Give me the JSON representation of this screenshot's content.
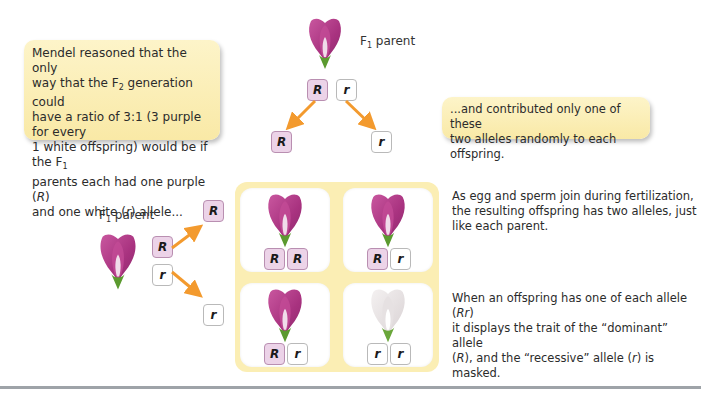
{
  "callouts": {
    "left": {
      "line1": "Mendel reasoned that the only",
      "line2_pre": "way that the F",
      "line2_sub": "2",
      "line2_post": " generation could",
      "line3": "have a ratio of 3:1 (3 purple for every",
      "line4_pre": "1 white offspring) would be if the F",
      "line4_sub": "1",
      "line5_pre": "parents each had one purple (",
      "line5_em": "R",
      "line5_post": ")",
      "line6_pre": "and one white (",
      "line6_em": "r",
      "line6_post": ") allele..."
    },
    "right": {
      "line1": "...and contributed only one of these",
      "line2": "two alleles randomly to each offspring."
    }
  },
  "parents": {
    "top": {
      "label_pre": "F",
      "label_sub": "1",
      "label_post": " parent",
      "alleles": [
        "R",
        "r"
      ],
      "gametes": [
        "R",
        "r"
      ]
    },
    "left": {
      "label_pre": "F",
      "label_sub": "1",
      "label_post": " parent",
      "alleles": [
        "R",
        "r"
      ],
      "gametes": [
        "R",
        "r"
      ]
    }
  },
  "punnett": {
    "cells": [
      {
        "flower": "purple",
        "alleles": [
          "R",
          "R"
        ]
      },
      {
        "flower": "purple",
        "alleles": [
          "R",
          "r"
        ]
      },
      {
        "flower": "purple",
        "alleles": [
          "R",
          "r"
        ]
      },
      {
        "flower": "white",
        "alleles": [
          "r",
          "r"
        ]
      }
    ]
  },
  "descriptions": {
    "fertilization": {
      "line1": "As egg and sperm join during fertilization,",
      "line2": "the resulting offspring has two alleles, just",
      "line3": "like each parent."
    },
    "dominance": {
      "line1_pre": "When an offspring has one of each allele (",
      "line1_em": "Rr",
      "line1_post": ")",
      "line2": "it displays the trait of the “dominant” allele",
      "line3_pre": "(",
      "line3_em": "R",
      "line3_mid": "), and the “recessive” allele (",
      "line3_em2": "r",
      "line3_post": ") is masked."
    }
  },
  "colors": {
    "callout_bg": "#fbefb9",
    "grid_bg": "#fbeeb4",
    "dominant_tile": "#ecd3e8",
    "recessive_tile": "#ffffff",
    "arrow": "#f39a2e",
    "purple_petal": "#b5418f",
    "white_petal": "#eeeaea"
  }
}
